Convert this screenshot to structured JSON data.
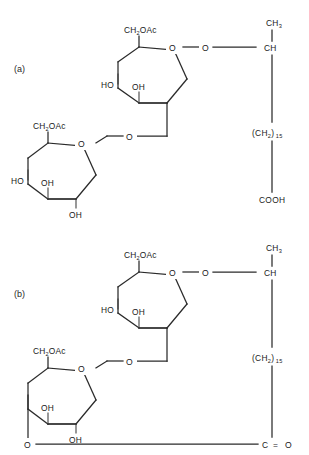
{
  "figure": {
    "background_color": "#ffffff",
    "line_color": "#2a2a2a",
    "panels": [
      {
        "id": "a",
        "label": "(a)",
        "description": "Disaccharide with free hydroxyl and terminal carboxylic acid chain",
        "upper_ring": {
          "c6_label": "CH",
          "c6_sub": "2",
          "c6_acyl": "OAc",
          "ring_oxygen": "O",
          "left_hydroxyl": "HO",
          "mid_hydroxyl": "OH"
        },
        "lower_ring": {
          "c6_label": "CH",
          "c6_sub": "2",
          "c6_acyl": "OAc",
          "ring_oxygen": "O",
          "left_hydroxyl": "HO",
          "mid_hydroxyl": "OH",
          "bottom_hydroxyl": "OH"
        },
        "glycosidic_oxygen": "O",
        "aglycone_oxygen": "O",
        "chain": {
          "methyl": "CH",
          "methyl_sub": "3",
          "methine": "CH",
          "methylene": "(CH",
          "methylene_sub": "2",
          "methylene_close": ")",
          "repeat_count": "15",
          "terminus": "COOH"
        }
      },
      {
        "id": "b",
        "label": "(b)",
        "description": "Macrolactone form with ester linkage closing the ring",
        "upper_ring": {
          "c6_label": "CH",
          "c6_sub": "2",
          "c6_acyl": "OAc",
          "ring_oxygen": "O",
          "left_hydroxyl": "HO",
          "mid_hydroxyl": "OH"
        },
        "lower_ring": {
          "c6_label": "CH",
          "c6_sub": "2",
          "c6_acyl": "OAc",
          "ring_oxygen": "O",
          "mid_hydroxyl": "OH",
          "bottom_hydroxyl": "OH",
          "ester_oxygen": "O"
        },
        "glycosidic_oxygen": "O",
        "aglycone_oxygen": "O",
        "chain": {
          "methyl": "CH",
          "methyl_sub": "3",
          "methine": "CH",
          "methylene": "(CH",
          "methylene_sub": "2",
          "methylene_close": ")",
          "repeat_count": "15",
          "terminus_c": "C",
          "terminus_eq": "=",
          "terminus_o": "O"
        }
      }
    ]
  }
}
